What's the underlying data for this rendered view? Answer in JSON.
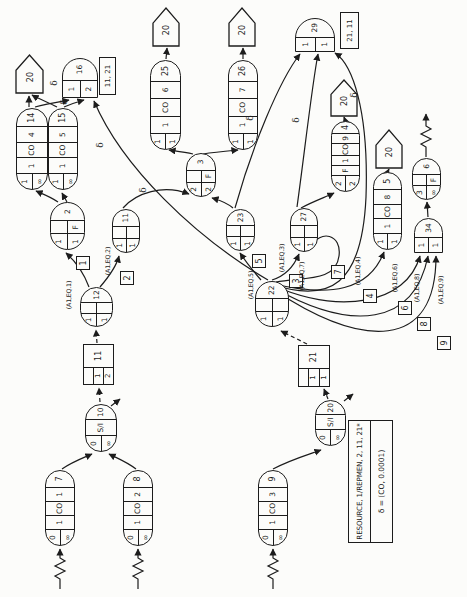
{
  "canvas": {
    "frame_w": 467,
    "frame_h": 597,
    "stage_w": 597,
    "stage_h": 467,
    "ink": "#1c1c1c",
    "paper": "#fcfcfa"
  },
  "legend": {
    "line1": "RESOURCE, 1/REPMEN, 2, 11, 21*",
    "line2": "δ = (CO, 0.0001)",
    "x": 54,
    "y": 348,
    "w": 123,
    "h": 45
  },
  "pentagons": [
    {
      "label": "20",
      "x": 504,
      "y": 16,
      "w": 38,
      "h": 27
    },
    {
      "label": "20",
      "x": 551,
      "y": 153,
      "w": 38,
      "h": 26
    },
    {
      "label": "20",
      "x": 551,
      "y": 229,
      "w": 38,
      "h": 26
    },
    {
      "label": "20",
      "x": 481,
      "y": 331,
      "w": 36,
      "h": 26
    },
    {
      "label": "20",
      "x": 429,
      "y": 376,
      "w": 38,
      "h": 26
    }
  ],
  "pills": [
    {
      "id": "queue-14",
      "top": "1",
      "bottom": "∞",
      "cells": [
        "1",
        "CO",
        "4"
      ],
      "num": "14",
      "x": 407,
      "y": 16,
      "w": 82,
      "h": 32
    },
    {
      "id": "queue-15",
      "top": "1",
      "bottom": "∞",
      "cells": [
        "1",
        "CO",
        "5"
      ],
      "num": "15",
      "x": 407,
      "y": 48,
      "w": 82,
      "h": 30
    },
    {
      "id": "queue-25",
      "top": "1",
      "bottom": "1",
      "cells": [
        "1",
        "CO",
        "6"
      ],
      "num": "25",
      "x": 447,
      "y": 150,
      "w": 90,
      "h": 31
    },
    {
      "id": "queue-26",
      "top": "1",
      "bottom": "1",
      "cells": [
        "1",
        "CO",
        "7"
      ],
      "num": "26",
      "x": 447,
      "y": 228,
      "w": 90,
      "h": 30
    },
    {
      "id": "queue-4",
      "top": "2",
      "bottom": "2",
      "f": "F",
      "cells": [
        "1",
        "CO",
        "9"
      ],
      "num": "4",
      "x": 405,
      "y": 331,
      "w": 71,
      "h": 29
    },
    {
      "id": "queue-5",
      "top": "1",
      "bottom": "1",
      "cells": [
        "1",
        "CO",
        "8"
      ],
      "num": "5",
      "x": 347,
      "y": 373,
      "w": 78,
      "h": 29
    },
    {
      "id": "source-7",
      "top": "0",
      "bottom": "∞",
      "cells": [
        "1",
        "CO",
        "1"
      ],
      "num": "7",
      "x": 51,
      "y": 45,
      "w": 76,
      "h": 30
    },
    {
      "id": "source-8",
      "top": "0",
      "bottom": "∞",
      "cells": [
        "1",
        "CO",
        "2"
      ],
      "num": "8",
      "x": 51,
      "y": 123,
      "w": 76,
      "h": 30
    },
    {
      "id": "source-9",
      "top": "0",
      "bottom": "∞",
      "cells": [
        "1",
        "CO",
        "3"
      ],
      "num": "9",
      "x": 51,
      "y": 258,
      "w": 76,
      "h": 30
    }
  ],
  "s_nodes": [
    {
      "id": "selector-10",
      "top": "0",
      "bottom": "∞",
      "mid": "S/I",
      "num": "10",
      "x": 145,
      "y": 85,
      "w": 48,
      "h": 32
    },
    {
      "id": "selector-20",
      "top": "0",
      "bottom": "∞",
      "mid": "S/I",
      "num": "20",
      "x": 151,
      "y": 315,
      "w": 46,
      "h": 31
    }
  ],
  "ovals": [
    {
      "id": "node-2",
      "a": "1",
      "b": "1",
      "f": "F",
      "num": "2",
      "x": 347,
      "y": 50,
      "w": 48,
      "h": 35
    },
    {
      "id": "node-3",
      "a": "2",
      "b": "2",
      "f": "F",
      "num": "3",
      "x": 400,
      "y": 186,
      "w": 44,
      "h": 30
    },
    {
      "id": "node-6",
      "a": "3",
      "b": "∞",
      "f": "F",
      "num": "6",
      "x": 397,
      "y": 412,
      "w": 42,
      "h": 29
    },
    {
      "id": "node-11",
      "a": "1",
      "b": "1",
      "f": "",
      "num": "11",
      "x": 344,
      "y": 112,
      "w": 44,
      "h": 28
    },
    {
      "id": "node-12",
      "a": "1",
      "b": "1",
      "f": "",
      "num": "12",
      "x": 270,
      "y": 80,
      "w": 40,
      "h": 33
    },
    {
      "id": "node-22",
      "a": "1",
      "b": "1",
      "f": "",
      "num": "22",
      "x": 270,
      "y": 255,
      "w": 46,
      "h": 34
    },
    {
      "id": "node-23",
      "a": "1",
      "b": "1",
      "f": "",
      "num": "23",
      "x": 346,
      "y": 226,
      "w": 42,
      "h": 29
    },
    {
      "id": "node-27",
      "a": "1",
      "b": "1",
      "f": "",
      "num": "27",
      "x": 345,
      "y": 290,
      "w": 44,
      "h": 28
    }
  ],
  "half_nodes": [
    {
      "id": "node-16",
      "a": "1",
      "b": "2",
      "num": "16",
      "x": 499,
      "y": 62,
      "w": 40,
      "h": 36
    },
    {
      "id": "node-29",
      "a": "1",
      "b": "1",
      "num": "29",
      "x": 545,
      "y": 295,
      "w": 34,
      "h": 40
    },
    {
      "id": "node-34",
      "a": "1",
      "b": "1",
      "num": "34",
      "x": 344,
      "y": 414,
      "w": 35,
      "h": 29
    }
  ],
  "attached_boxes": [
    {
      "id": "free-list-16",
      "label": "11, 21",
      "x": 502,
      "y": 99,
      "w": 38,
      "h": 17
    },
    {
      "id": "free-list-29",
      "label": "21, 11",
      "x": 548,
      "y": 340,
      "w": 37,
      "h": 19
    }
  ],
  "resource_blocks": [
    {
      "id": "resource-block-11",
      "rows": [
        "",
        "1",
        "2"
      ],
      "num": "11",
      "x": 212,
      "y": 83,
      "w": 41,
      "h": 31
    },
    {
      "id": "resource-block-21",
      "rows": [
        "",
        "1",
        "1"
      ],
      "num": "21",
      "x": 210,
      "y": 298,
      "w": 42,
      "h": 32
    }
  ],
  "activity_boxes": [
    {
      "label": "1",
      "x": 327,
      "y": 76
    },
    {
      "label": "2",
      "x": 312,
      "y": 120
    },
    {
      "label": "5",
      "x": 329,
      "y": 252
    },
    {
      "label": "3",
      "x": 309,
      "y": 289
    },
    {
      "label": "7",
      "x": 318,
      "y": 331
    },
    {
      "label": "4",
      "x": 294,
      "y": 363
    },
    {
      "label": "6",
      "x": 282,
      "y": 398
    },
    {
      "label": "8",
      "x": 266,
      "y": 417
    },
    {
      "label": "9",
      "x": 247,
      "y": 437
    }
  ],
  "condition_labels": [
    {
      "text": "(A1,EQ.1)",
      "x": 302,
      "y": 68
    },
    {
      "text": "(A1,EQ.2)",
      "x": 336,
      "y": 107
    },
    {
      "text": "(A1,EQ.5)",
      "x": 312,
      "y": 250
    },
    {
      "text": "(A1,EQ.3)",
      "x": 339,
      "y": 281
    },
    {
      "text": "(A1,EQ.7)",
      "x": 321,
      "y": 301
    },
    {
      "text": "(A1,EQ.4)",
      "x": 326,
      "y": 357
    },
    {
      "text": "(A1,EQ.6)",
      "x": 319,
      "y": 394
    },
    {
      "text": "(A1,EQ.8)",
      "x": 309,
      "y": 416
    },
    {
      "text": "(A1,EQ.9)",
      "x": 307,
      "y": 440
    }
  ],
  "delta_labels": [
    {
      "text": "δ",
      "x": 514,
      "y": 54
    },
    {
      "text": "δ",
      "x": 495,
      "y": 64
    },
    {
      "text": "δ",
      "x": 452,
      "y": 100
    },
    {
      "text": "δ",
      "x": 407,
      "y": 143
    },
    {
      "text": "δ",
      "x": 479,
      "y": 250
    },
    {
      "text": "δ",
      "x": 477,
      "y": 296
    },
    {
      "text": "δ",
      "x": 502,
      "y": 354
    }
  ],
  "edges": [
    {
      "name": "arrival-arrow-7",
      "d": "M 8 60 L 18 60 l 3 -5 l 5 10 l 5 -10 l 5 10 l 3 -5 L 48 60"
    },
    {
      "name": "arrival-arrow-8",
      "d": "M 8 138 L 18 138 l 3 -5 l 5 10 l 5 -10 l 5 10 l 3 -5 L 48 138"
    },
    {
      "name": "arrival-arrow-9",
      "d": "M 8 273 L 18 273 l 3 -5 l 5 10 l 5 -10 l 5 10 l 3 -5 L 48 273"
    },
    {
      "name": "edge-7-10",
      "d": "M 128 62 C 135 72 139 83 143 92"
    },
    {
      "name": "edge-8-10",
      "d": "M 128 136 C 135 127 139 117 143 109"
    },
    {
      "name": "edge-9-20s",
      "d": "M 128 273 C 137 290 142 307 147 321"
    },
    {
      "name": "edge-10-block11",
      "d": "M 195 100 L 209 99",
      "dash": true
    },
    {
      "name": "edge-block11-12",
      "d": "M 254 97 L 267 96",
      "dash": true
    },
    {
      "name": "edge-20s-block21",
      "d": "M 198 328 L 208 324",
      "dash": true
    },
    {
      "name": "edge-block21-22",
      "d": "M 253 307 L 266 281",
      "dash": true
    },
    {
      "name": "edge-12-2",
      "d": "M 310 89 C 326 83 337 74 344 66"
    },
    {
      "name": "edge-12-11",
      "d": "M 310 100 C 324 112 333 117 341 119"
    },
    {
      "name": "edge-2-14",
      "d": "M 395 58 C 400 51 403 43 406 36"
    },
    {
      "name": "edge-2-15",
      "d": "M 395 67 L 404 62"
    },
    {
      "name": "edge-14-sink",
      "d": "M 490 29 L 501 29"
    },
    {
      "name": "edge-15-sink",
      "d": "M 490 57 C 495 48 498 39 502 32"
    },
    {
      "name": "edge-14-16",
      "d": "M 490 35 C 493 46 495 58 497 69"
    },
    {
      "name": "edge-15-16",
      "d": "M 490 64 C 493 71 495 77 497 84"
    },
    {
      "name": "edge-22-16",
      "d": "M 317 268 C 360 195 430 122 496 94"
    },
    {
      "name": "edge-11-3",
      "d": "M 389 123 C 404 136 413 163 403 189"
    },
    {
      "name": "edge-23-3",
      "d": "M 389 233 C 395 226 397 219 399 212"
    },
    {
      "name": "edge-3-25",
      "d": "M 443 193 C 445 185 446 176 447 169"
    },
    {
      "name": "edge-3-26",
      "d": "M 443 203 C 445 215 446 227 447 238"
    },
    {
      "name": "edge-25-sink",
      "d": "M 538 166 L 549 167"
    },
    {
      "name": "edge-26-sink",
      "d": "M 538 243 L 549 243"
    },
    {
      "name": "edge-27-4",
      "d": "M 389 301 C 396 314 400 326 404 334"
    },
    {
      "name": "edge-4-sink",
      "d": "M 477 345 L 480 344"
    },
    {
      "name": "edge-5-sink",
      "d": "M 426 388 L 428 389"
    },
    {
      "name": "edge-23-29",
      "d": "M 389 235 C 450 252 516 279 543 300"
    },
    {
      "name": "edge-27-29",
      "d": "M 390 297 C 440 304 512 312 543 318"
    },
    {
      "name": "edge-22-29",
      "d": "M 313 271 C 293 330 312 362 400 366 C 488 369 533 352 544 335"
    },
    {
      "name": "edge-22-23",
      "d": "M 317 261 C 325 254 335 246 344 240"
    },
    {
      "name": "edge-22-27a",
      "d": "M 317 272 C 321 285 331 294 343 299"
    },
    {
      "name": "edge-22-27b",
      "d": "M 315 276 C 320 304 315 336 341 339 C 363 342 368 320 350 311"
    },
    {
      "name": "edge-22-5",
      "d": "M 313 274 C 300 330 306 369 345 384"
    },
    {
      "name": "edge-22-34a",
      "d": "M 311 274 C 283 340 292 406 341 420"
    },
    {
      "name": "edge-22-34b",
      "d": "M 309 274 C 265 352 271 414 341 428"
    },
    {
      "name": "edge-22-34c",
      "d": "M 307 274 C 249 362 245 436 341 436"
    },
    {
      "name": "edge-34-6",
      "d": "M 380 428 L 395 427"
    },
    {
      "name": "edge-6-out",
      "d": "M 440 426 L 450 426 l 3 -5 l 5 10 l 5 -10 l 5 10 l 3 -5 L 483 426"
    },
    {
      "name": "stub-10",
      "d": "M 191 111 L 198 120"
    },
    {
      "name": "stub-20s",
      "d": "M 196 344 L 203 353"
    }
  ]
}
